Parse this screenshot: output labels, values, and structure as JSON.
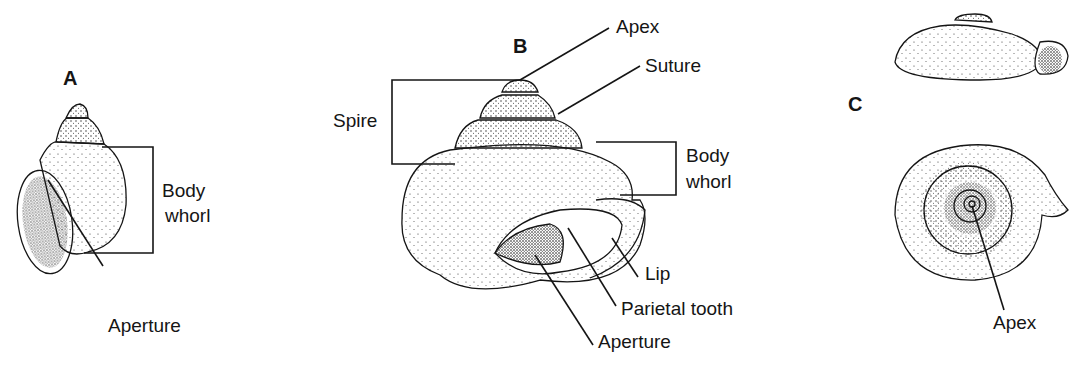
{
  "figure": {
    "panels": [
      {
        "id": "A",
        "letter": "A",
        "subject": "high-spired snail shell, apertural view",
        "labels": {
          "body_whorl_1": "Body",
          "body_whorl_2": "whorl",
          "aperture": "Aperture"
        }
      },
      {
        "id": "B",
        "letter": "B",
        "subject": "conical snail shell, apertural view",
        "labels": {
          "apex": "Apex",
          "suture": "Suture",
          "spire": "Spire",
          "body_whorl_1": "Body",
          "body_whorl_2": "whorl",
          "lip": "Lip",
          "parietal_tooth": "Parietal tooth",
          "aperture": "Aperture"
        }
      },
      {
        "id": "C",
        "letter": "C",
        "subject": "flat-coiled snail shell, side and top views",
        "labels": {
          "apex": "Apex"
        }
      }
    ],
    "colors": {
      "ink": "#151515",
      "background": "#ffffff"
    }
  }
}
